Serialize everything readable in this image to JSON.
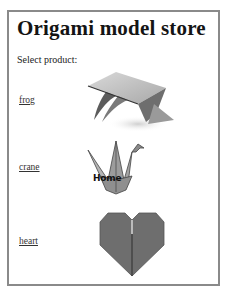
{
  "page": {
    "title": "Origami model store",
    "prompt": "Select product:"
  },
  "products": [
    {
      "label": "frog",
      "image": "frog-origami-image"
    },
    {
      "label": "crane",
      "image": "crane-origami-image",
      "overlay_text": "Home"
    },
    {
      "label": "heart",
      "image": "heart-origami-image"
    }
  ],
  "colors": {
    "border": "#8a8a8a",
    "heart": "#6e6e6e",
    "link": "#333333"
  }
}
